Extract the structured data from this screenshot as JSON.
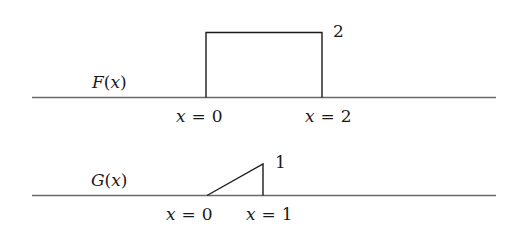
{
  "diagram": {
    "panels": [
      {
        "function_label": "F(x)",
        "function_name": "F",
        "function_arg": "x",
        "shape": "rectangle",
        "height_label": "2",
        "x_labels": [
          {
            "var": "x",
            "eq": "=",
            "val": "0"
          },
          {
            "var": "x",
            "eq": "=",
            "val": "2"
          }
        ]
      },
      {
        "function_label": "G(x)",
        "function_name": "G",
        "function_arg": "x",
        "shape": "right-triangle ramp",
        "height_label": "1",
        "x_labels": [
          {
            "var": "x",
            "eq": "=",
            "val": "0"
          },
          {
            "var": "x",
            "eq": "=",
            "val": "1"
          }
        ]
      }
    ],
    "colors": {
      "axis": "#6a6a6a",
      "ink": "#1a1a1a",
      "background": "#ffffff"
    }
  }
}
